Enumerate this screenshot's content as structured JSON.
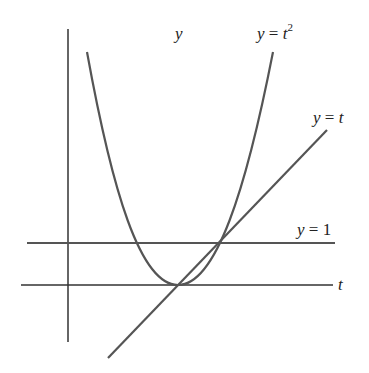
{
  "diagram": {
    "type": "function-plot",
    "axes": {
      "vertical_label": "y",
      "horizontal_label": "t"
    },
    "curves": [
      {
        "name": "parabola",
        "label_lhs": "y",
        "label_eq": " = ",
        "label_var": "t",
        "label_exp": "2"
      },
      {
        "name": "line",
        "label_lhs": "y",
        "label_eq": " = ",
        "label_var": "t"
      },
      {
        "name": "horizontal",
        "label_lhs": "y",
        "label_eq": " = ",
        "label_num": "1"
      }
    ],
    "colors": {
      "curve": "#555555",
      "axis": "#333333",
      "text": "#222222",
      "background": "#ffffff"
    }
  }
}
